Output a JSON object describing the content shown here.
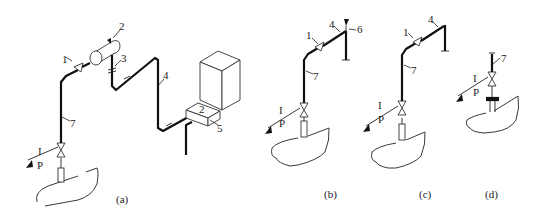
{
  "figure": {
    "panels": [
      {
        "id": "a",
        "caption": "(a)",
        "labels": {
          "l1": "1",
          "l2": "2",
          "l3": "3",
          "l4": "4",
          "l5": "5",
          "l7": "7",
          "I": "I",
          "P": "P"
        },
        "box_glyph": "2"
      },
      {
        "id": "b",
        "caption": "(b)",
        "labels": {
          "l1": "1",
          "l4": "4",
          "l6": "6",
          "l7": "7",
          "I": "I",
          "P": "P"
        }
      },
      {
        "id": "c",
        "caption": "(c)",
        "labels": {
          "l1": "1",
          "l4": "4",
          "l7": "7",
          "I": "I",
          "P": "P"
        }
      },
      {
        "id": "d",
        "caption": "(d)",
        "labels": {
          "l7": "7",
          "I": "I",
          "P": "P"
        }
      }
    ]
  },
  "colors": {
    "line": "#111111",
    "background": "#ffffff"
  }
}
